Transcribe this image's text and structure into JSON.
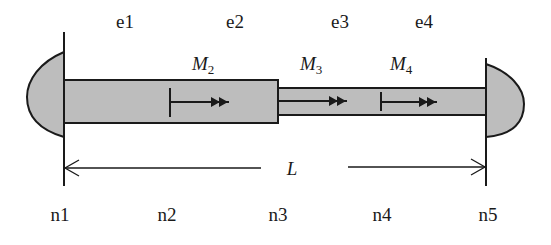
{
  "diagram": {
    "type": "stepped shaft / bar finite element model",
    "fill_color": "#bdbdbd",
    "stroke_color": "#1a1a1a",
    "element_labels": [
      "e1",
      "e2",
      "e3",
      "e4"
    ],
    "node_labels": [
      "n1",
      "n2",
      "n3",
      "n4",
      "n5"
    ],
    "moments": [
      {
        "symbol": "M",
        "subscript": "2",
        "location": "wide section, near n2"
      },
      {
        "symbol": "M",
        "subscript": "3",
        "location": "at n3 step"
      },
      {
        "symbol": "M",
        "subscript": "4",
        "location": "thin section, near n4"
      }
    ],
    "dimension": {
      "label": "L",
      "from": "n1",
      "to": "n5"
    },
    "supports": [
      "left fixed end at n1",
      "right fixed end at n5"
    ]
  }
}
